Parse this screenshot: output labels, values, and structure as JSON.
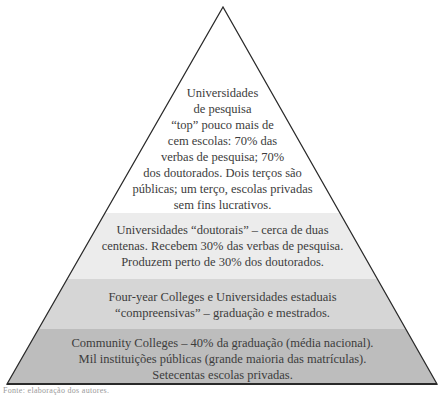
{
  "diagram": {
    "type": "pyramid",
    "colors": {
      "tier1": "#ffffff",
      "tier2": "#ececec",
      "tier3": "#d6d6d6",
      "tier4": "#bdbdbd",
      "outline": "#2a2a2a"
    },
    "tiers": [
      {
        "name": "universidades-de-pesquisa-top",
        "lines": [
          "Universidades",
          "de pesquisa",
          "“top” pouco mais de",
          "cem escolas: 70% das",
          "verbas de pesquisa; 70%",
          "dos doutorados. Dois terços são",
          "públicas; um terço, escolas privadas",
          "sem fins lucrativos."
        ]
      },
      {
        "name": "universidades-doutorais",
        "lines": [
          "Universidades “doutorais” – cerca de duas",
          "centenas. Recebem 30% das verbas de pesquisa.",
          "Produzem perto de 30% dos doutorados."
        ]
      },
      {
        "name": "four-year-colleges",
        "lines": [
          "Four-year Colleges e Universidades estaduais",
          "“compreensivas” – graduação e mestrados."
        ]
      },
      {
        "name": "community-colleges",
        "lines": [
          "Community Colleges – 40% da graduação (média nacional).",
          "Mil instituições públicas (grande maioria das matrículas).",
          "Setecentas escolas privadas."
        ]
      }
    ],
    "source_note": "Fonte: elaboração dos autores."
  }
}
